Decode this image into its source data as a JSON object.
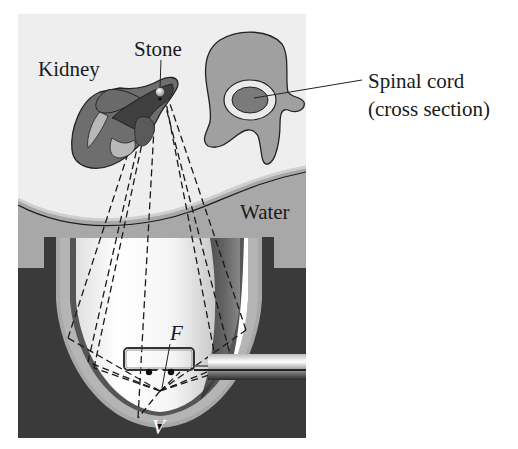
{
  "figure": {
    "type": "illustration",
    "labels": {
      "kidney": "Kidney",
      "stone": "Stone",
      "spinal_cord_line1": "Spinal cord",
      "spinal_cord_line2": "(cross section)",
      "water": "Water",
      "focus": "F",
      "vertex": "V"
    },
    "colors": {
      "background_panel": "#eeeeee",
      "water": "#a8a8a8",
      "reflector_housing": "#3a3a3a",
      "kidney_outer": "#6e6e6e",
      "kidney_inner": "#4a4a4a",
      "kidney_light": "#b8b8b8",
      "vertebra": "#a0a0a0",
      "spinal_cord": "#7a7a7a",
      "reflector_interior": "#f6f6f6"
    }
  }
}
